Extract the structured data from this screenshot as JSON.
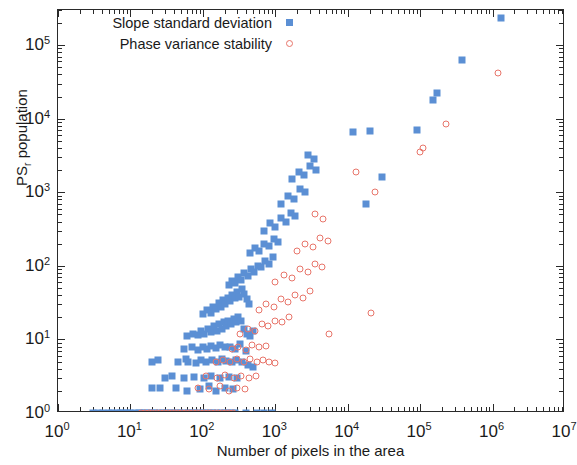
{
  "chart_data": {
    "type": "scatter",
    "title": "",
    "xlabel": "Number of pixels in the area",
    "ylabel": "PS_r population",
    "ylabel_base": "PS",
    "ylabel_sub": "r",
    "ylabel_tail": " population",
    "xscale": "log",
    "yscale": "log",
    "xlim": [
      1,
      10000000
    ],
    "ylim": [
      1,
      300000
    ],
    "grid": false,
    "legend_position": "top-left",
    "xticks": [
      {
        "value": 1,
        "label_base": "10",
        "label_exp": "0"
      },
      {
        "value": 10,
        "label_base": "10",
        "label_exp": "1"
      },
      {
        "value": 100,
        "label_base": "10",
        "label_exp": "2"
      },
      {
        "value": 1000,
        "label_base": "10",
        "label_exp": "3"
      },
      {
        "value": 10000,
        "label_base": "10",
        "label_exp": "4"
      },
      {
        "value": 100000,
        "label_base": "10",
        "label_exp": "5"
      },
      {
        "value": 1000000,
        "label_base": "10",
        "label_exp": "6"
      },
      {
        "value": 10000000,
        "label_base": "10",
        "label_exp": "7"
      }
    ],
    "yticks": [
      {
        "value": 1,
        "label_base": "10",
        "label_exp": "0"
      },
      {
        "value": 10,
        "label_base": "10",
        "label_exp": "1"
      },
      {
        "value": 100,
        "label_base": "10",
        "label_exp": "2"
      },
      {
        "value": 1000,
        "label_base": "10",
        "label_exp": "3"
      },
      {
        "value": 10000,
        "label_base": "10",
        "label_exp": "4"
      },
      {
        "value": 100000,
        "label_base": "10",
        "label_exp": "5"
      }
    ],
    "series": [
      {
        "name": "Slope standard deviation",
        "marker": "filled-square",
        "color": "#5b8fd4",
        "points": [
          [
            3.0,
            1
          ],
          [
            3.6,
            1
          ],
          [
            4.2,
            1
          ],
          [
            5.0,
            1
          ],
          [
            5.6,
            1
          ],
          [
            6.5,
            1
          ],
          [
            7.2,
            1
          ],
          [
            8.0,
            1
          ],
          [
            9.0,
            1
          ],
          [
            10.0,
            1
          ],
          [
            11.5,
            1
          ],
          [
            13.0,
            1
          ],
          [
            14.5,
            1
          ],
          [
            16.0,
            1
          ],
          [
            18.0,
            1
          ],
          [
            20.0,
            1
          ],
          [
            22.0,
            1
          ],
          [
            25.0,
            1
          ],
          [
            28.0,
            1
          ],
          [
            31.0,
            1
          ],
          [
            35.0,
            1
          ],
          [
            39.0,
            1
          ],
          [
            44.0,
            1
          ],
          [
            49.0,
            1
          ],
          [
            55.0,
            1
          ],
          [
            62.0,
            1
          ],
          [
            70.0,
            1
          ],
          [
            78.0,
            1
          ],
          [
            88.0,
            1
          ],
          [
            99.0,
            1
          ],
          [
            111.0,
            1
          ],
          [
            125.0,
            1
          ],
          [
            140.0,
            1
          ],
          [
            158.0,
            1
          ],
          [
            177.0,
            1
          ],
          [
            199.0,
            1
          ],
          [
            224.0,
            1
          ],
          [
            251.0,
            1
          ],
          [
            282.0,
            1
          ],
          [
            400.0,
            1
          ],
          [
            560.0,
            1
          ],
          [
            700.0,
            1
          ],
          [
            900.0,
            1
          ],
          [
            20.0,
            2.2
          ],
          [
            26.0,
            2.2
          ],
          [
            42.0,
            2.2
          ],
          [
            60.0,
            2.0
          ],
          [
            90.0,
            2.1
          ],
          [
            120.0,
            2.3
          ],
          [
            150.0,
            2.0
          ],
          [
            200.0,
            2.2
          ],
          [
            260.0,
            2.1
          ],
          [
            30.0,
            3.0
          ],
          [
            38.0,
            3.2
          ],
          [
            55.0,
            3.0
          ],
          [
            75.0,
            3.1
          ],
          [
            105.0,
            3.0
          ],
          [
            130.0,
            3.2
          ],
          [
            170.0,
            3.0
          ],
          [
            230.0,
            3.1
          ],
          [
            300.0,
            3.0
          ],
          [
            20.0,
            5.0
          ],
          [
            24.0,
            5.2
          ],
          [
            45.0,
            5.0
          ],
          [
            58.0,
            5.5
          ],
          [
            62.0,
            5.0
          ],
          [
            80.0,
            4.8
          ],
          [
            95.0,
            5.2
          ],
          [
            110.0,
            5.0
          ],
          [
            135.0,
            5.3
          ],
          [
            160.0,
            5.0
          ],
          [
            185.0,
            5.4
          ],
          [
            210.0,
            5.1
          ],
          [
            250.0,
            5.0
          ],
          [
            290.0,
            5.2
          ],
          [
            350.0,
            5.0
          ],
          [
            420.0,
            4.5
          ],
          [
            500.0,
            4.2
          ],
          [
            55.0,
            7.5
          ],
          [
            70.0,
            7.8
          ],
          [
            85.0,
            7.2
          ],
          [
            100.0,
            8.0
          ],
          [
            115.0,
            7.5
          ],
          [
            130.0,
            8.2
          ],
          [
            150.0,
            7.6
          ],
          [
            175.0,
            8.5
          ],
          [
            205.0,
            7.8
          ],
          [
            240.0,
            8.0
          ],
          [
            280.0,
            7.5
          ],
          [
            330.0,
            8.8
          ],
          [
            390.0,
            7.0
          ],
          [
            60.0,
            11.0
          ],
          [
            72.0,
            12.0
          ],
          [
            85.0,
            11.5
          ],
          [
            95.0,
            13.0
          ],
          [
            105.0,
            12.0
          ],
          [
            118.0,
            14.0
          ],
          [
            130.0,
            12.5
          ],
          [
            142.0,
            15.0
          ],
          [
            155.0,
            13.0
          ],
          [
            168.0,
            16.0
          ],
          [
            182.0,
            14.0
          ],
          [
            195.0,
            17.0
          ],
          [
            210.0,
            15.0
          ],
          [
            225.0,
            18.0
          ],
          [
            245.0,
            16.0
          ],
          [
            265.0,
            19.0
          ],
          [
            285.0,
            17.0
          ],
          [
            310.0,
            20.0
          ],
          [
            340.0,
            18.0
          ],
          [
            370.0,
            14.0
          ],
          [
            410.0,
            12.0
          ],
          [
            450.0,
            11.0
          ],
          [
            500.0,
            13.0
          ],
          [
            100.0,
            22.0
          ],
          [
            115.0,
            25.0
          ],
          [
            128.0,
            23.0
          ],
          [
            140.0,
            28.0
          ],
          [
            152.0,
            26.0
          ],
          [
            165.0,
            31.0
          ],
          [
            178.0,
            28.0
          ],
          [
            190.0,
            34.0
          ],
          [
            205.0,
            30.0
          ],
          [
            220.0,
            37.0
          ],
          [
            238.0,
            33.0
          ],
          [
            255.0,
            40.0
          ],
          [
            275.0,
            36.0
          ],
          [
            295.0,
            44.0
          ],
          [
            320.0,
            38.0
          ],
          [
            345.0,
            48.0
          ],
          [
            375.0,
            42.0
          ],
          [
            405.0,
            35.0
          ],
          [
            440.0,
            30.0
          ],
          [
            230.0,
            55.0
          ],
          [
            255.0,
            62.0
          ],
          [
            280.0,
            58.0
          ],
          [
            310.0,
            70.0
          ],
          [
            340.0,
            65.0
          ],
          [
            375.0,
            80.0
          ],
          [
            415.0,
            72.0
          ],
          [
            460.0,
            90.0
          ],
          [
            510.0,
            82.0
          ],
          [
            570.0,
            100.0
          ],
          [
            640.0,
            95.0
          ],
          [
            720.0,
            115.0
          ],
          [
            820.0,
            105.0
          ],
          [
            930.0,
            130.0
          ],
          [
            450.0,
            150.0
          ],
          [
            520.0,
            175.0
          ],
          [
            600.0,
            160.0
          ],
          [
            700.0,
            200.0
          ],
          [
            820.0,
            185.0
          ],
          [
            950.0,
            230.0
          ],
          [
            1100.0,
            210.0
          ],
          [
            700.0,
            300.0
          ],
          [
            850.0,
            380.0
          ],
          [
            1000.0,
            340.0
          ],
          [
            1200.0,
            450.0
          ],
          [
            1400.0,
            400.0
          ],
          [
            1650.0,
            520.0
          ],
          [
            1900.0,
            480.0
          ],
          [
            1200.0,
            700.0
          ],
          [
            1500.0,
            900.0
          ],
          [
            1800.0,
            800.0
          ],
          [
            2200.0,
            1100.0
          ],
          [
            2600.0,
            1000.0
          ],
          [
            1700.0,
            1500.0
          ],
          [
            2100.0,
            1900.0
          ],
          [
            2500.0,
            1700.0
          ],
          [
            3000.0,
            2300.0
          ],
          [
            3600.0,
            2000.0
          ],
          [
            2800.0,
            3200.0
          ],
          [
            3400.0,
            2800.0
          ],
          [
            18000.0,
            700.0
          ],
          [
            30000.0,
            1600.0
          ],
          [
            12000.0,
            6500.0
          ],
          [
            20000.0,
            6800.0
          ],
          [
            90000.0,
            7000.0
          ],
          [
            150000.0,
            18000.0
          ],
          [
            170000.0,
            22000.0
          ],
          [
            380000.0,
            62000.0
          ],
          [
            1300000.0,
            230000.0
          ]
        ]
      },
      {
        "name": "Phase variance stability",
        "marker": "open-circle",
        "color": "#e8756a",
        "points": [
          [
            14.0,
            1
          ],
          [
            16.0,
            1
          ],
          [
            18.0,
            1
          ],
          [
            20.0,
            1
          ],
          [
            23.0,
            1
          ],
          [
            26.0,
            1
          ],
          [
            29.0,
            1
          ],
          [
            33.0,
            1
          ],
          [
            37.0,
            1
          ],
          [
            41.0,
            1
          ],
          [
            46.0,
            1
          ],
          [
            52.0,
            1
          ],
          [
            58.0,
            1
          ],
          [
            65.0,
            1
          ],
          [
            73.0,
            1
          ],
          [
            82.0,
            1
          ],
          [
            92.0,
            1
          ],
          [
            103.0,
            1
          ],
          [
            116.0,
            1
          ],
          [
            130.0,
            1
          ],
          [
            146.0,
            1
          ],
          [
            164.0,
            1
          ],
          [
            184.0,
            1
          ],
          [
            207.0,
            1
          ],
          [
            232.0,
            1
          ],
          [
            260.0,
            1
          ],
          [
            85.0,
            2.2
          ],
          [
            120.0,
            2.1
          ],
          [
            170.0,
            2.3
          ],
          [
            230.0,
            2.0
          ],
          [
            300.0,
            2.2
          ],
          [
            380.0,
            2.1
          ],
          [
            110.0,
            3.2
          ],
          [
            155.0,
            3.0
          ],
          [
            205.0,
            3.3
          ],
          [
            270.0,
            3.0
          ],
          [
            340.0,
            3.2
          ],
          [
            430.0,
            3.0
          ],
          [
            540.0,
            3.2
          ],
          [
            150.0,
            5.0
          ],
          [
            190.0,
            5.3
          ],
          [
            240.0,
            5.0
          ],
          [
            300.0,
            5.5
          ],
          [
            370.0,
            5.0
          ],
          [
            450.0,
            5.4
          ],
          [
            560.0,
            5.0
          ],
          [
            680.0,
            5.3
          ],
          [
            820.0,
            5.0
          ],
          [
            1000.0,
            4.8
          ],
          [
            250.0,
            7.5
          ],
          [
            310.0,
            8.0
          ],
          [
            390.0,
            7.2
          ],
          [
            480.0,
            8.5
          ],
          [
            600.0,
            7.8
          ],
          [
            750.0,
            8.2
          ],
          [
            330.0,
            12.0
          ],
          [
            420.0,
            14.0
          ],
          [
            520.0,
            13.0
          ],
          [
            650.0,
            16.0
          ],
          [
            800.0,
            15.0
          ],
          [
            1000.0,
            18.0
          ],
          [
            1250.0,
            17.0
          ],
          [
            1550.0,
            20.0
          ],
          [
            5500.0,
            12.0
          ],
          [
            600.0,
            25.0
          ],
          [
            750.0,
            30.0
          ],
          [
            950.0,
            28.0
          ],
          [
            1200.0,
            35.0
          ],
          [
            1500.0,
            32.0
          ],
          [
            1900.0,
            40.0
          ],
          [
            2400.0,
            36.0
          ],
          [
            3000.0,
            45.0
          ],
          [
            21000.0,
            23.0
          ],
          [
            1000.0,
            60.0
          ],
          [
            1300.0,
            75.0
          ],
          [
            1700.0,
            68.0
          ],
          [
            2200.0,
            90.0
          ],
          [
            2800.0,
            82.0
          ],
          [
            3500.0,
            105.0
          ],
          [
            4400.0,
            95.0
          ],
          [
            2000.0,
            160.0
          ],
          [
            2600.0,
            200.0
          ],
          [
            3300.0,
            180.0
          ],
          [
            4200.0,
            240.0
          ],
          [
            5300.0,
            220.0
          ],
          [
            3500.0,
            500.0
          ],
          [
            4500.0,
            430.0
          ],
          [
            13000.0,
            1900.0
          ],
          [
            24000.0,
            1000.0
          ],
          [
            100000.0,
            3500.0
          ],
          [
            110000.0,
            4000.0
          ],
          [
            230000.0,
            8500.0
          ],
          [
            1200000.0,
            42000.0
          ]
        ]
      }
    ]
  },
  "legend": {
    "entries": [
      {
        "label": "Slope standard deviation",
        "marker": "filled-square"
      },
      {
        "label": "Phase variance stability",
        "marker": "open-circle"
      }
    ]
  }
}
